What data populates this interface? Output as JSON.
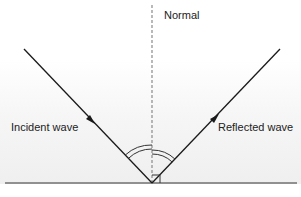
{
  "diagram": {
    "labels": {
      "normal": "Normal",
      "incident": "Incident wave",
      "reflected": "Reflected wave"
    },
    "colors": {
      "ray": "#1a1a1a",
      "normal_line": "#8a8a8a",
      "surface": "#333333",
      "background_fade": "#efefef",
      "text": "#222222"
    },
    "geometry": {
      "point_of_incidence": [
        152,
        183
      ],
      "incident_start": [
        24,
        49
      ],
      "reflected_end": [
        280,
        49
      ],
      "surface_y": 183,
      "surface_x_range": [
        5,
        297
      ],
      "normal_x": 152,
      "normal_y_range": [
        5,
        183
      ]
    },
    "annotations": {
      "angle_of_incidence": "double arc between incident ray and normal",
      "angle_of_reflection": "double arc between normal and reflected ray",
      "right_angle_marker": "square at base of normal"
    }
  }
}
